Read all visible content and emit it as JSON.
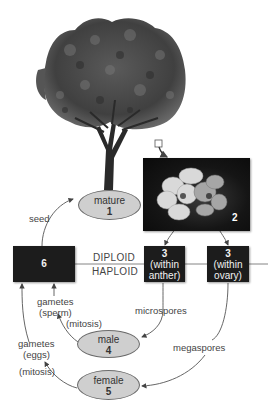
{
  "diagram": {
    "type": "plant life cycle (alternation of generations)",
    "stages": {
      "mature": {
        "label": "mature",
        "number": "1"
      },
      "flower": {
        "number": "2"
      },
      "anther": {
        "number": "3",
        "label": "(within\nanther)",
        "line1": "(within",
        "line2": "anther)"
      },
      "ovary": {
        "number": "3",
        "label": "(within\novary)",
        "line1": "(within",
        "line2": "ovary)"
      },
      "male": {
        "label": "male",
        "number": "4"
      },
      "female": {
        "label": "female",
        "number": "5"
      },
      "zygote": {
        "number": "6"
      }
    },
    "divider": {
      "top": "DIPLOID",
      "bottom": "HAPLOID"
    },
    "arrow_labels": {
      "seed": "seed",
      "microspores": "microspores",
      "megaspores": "megaspores",
      "gametes_sperm_1": "gametes",
      "gametes_sperm_2": "(sperm)",
      "mitosis_male": "(mitosis)",
      "gametes_eggs_1": "gametes",
      "gametes_eggs_2": "(eggs)",
      "mitosis_female": "(mitosis)"
    },
    "colors": {
      "ellipse_fill": "#cfcfcf",
      "box_fill": "#1c1c1c",
      "line": "#555555"
    }
  }
}
